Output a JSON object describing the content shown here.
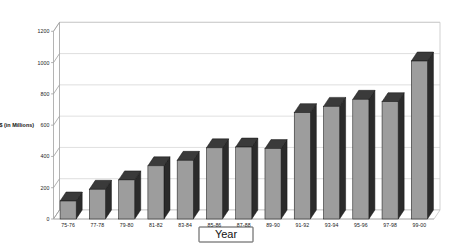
{
  "chart_data": {
    "type": "bar",
    "title": "",
    "subtitle": "",
    "xlabel": "Year",
    "ylabel": "$ (in Millions)",
    "categories": [
      "75-76",
      "77-78",
      "79-80",
      "81-82",
      "83-84",
      "85-86",
      "87-88",
      "89-90",
      "91-92",
      "93-94",
      "95-96",
      "97-98",
      "99-00"
    ],
    "values": [
      115,
      190,
      250,
      340,
      375,
      455,
      460,
      450,
      680,
      720,
      765,
      750,
      1010
    ],
    "ylim": [
      0,
      1200
    ],
    "yticks": [
      0,
      200,
      400,
      600,
      800,
      1000,
      1200
    ],
    "ytick_labels": [
      "0",
      "200",
      "400",
      "600",
      "800",
      "1000",
      "1200"
    ],
    "grid": true,
    "legend": false,
    "legend_position": "none",
    "style": "3d-column",
    "colors": {
      "bar_face": "#9d9d9d",
      "bar_side": "#2b2b2b",
      "bar_top": "#3a3a3a",
      "gridline": "#c9c9c9",
      "axis": "#a8a8a8",
      "text": "#111111",
      "background": "#ffffff"
    }
  },
  "axis": {
    "y_label_text": "$ (in Millions)",
    "x_title_text": "Year"
  }
}
